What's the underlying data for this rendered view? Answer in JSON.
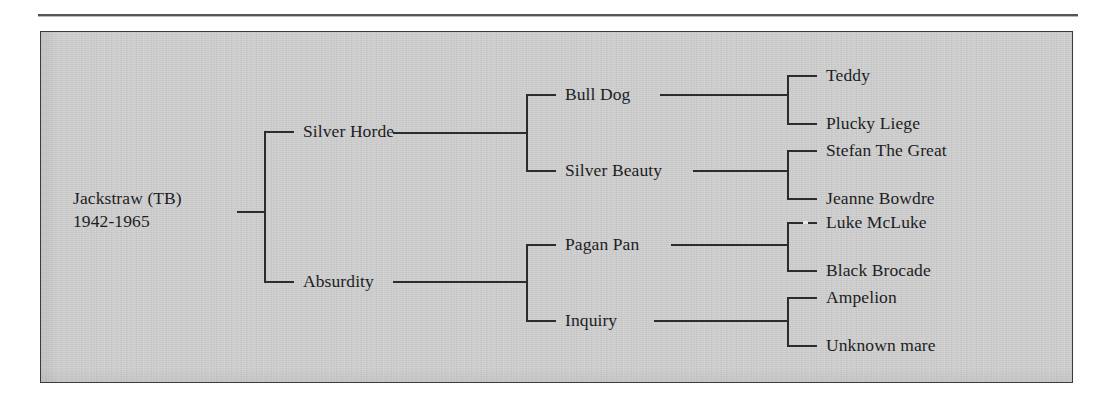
{
  "figure": {
    "background_color": "#c9c9c9",
    "line_color": "#2c2c2e",
    "text_color": "#1d1d1f",
    "type": "pedigree-tree"
  },
  "tree": {
    "root": {
      "name": "Jackstraw (TB)",
      "years": "1942-1965"
    },
    "generation2": [
      {
        "label": "Silver Horde"
      },
      {
        "label": "Absurdity"
      }
    ],
    "generation3": [
      {
        "label": "Bull Dog"
      },
      {
        "label": "Silver Beauty"
      },
      {
        "label": "Pagan Pan"
      },
      {
        "label": "Inquiry"
      }
    ],
    "generation4": [
      {
        "label": "Teddy"
      },
      {
        "label": "Plucky Liege"
      },
      {
        "label": "Stefan The Great"
      },
      {
        "label": "Jeanne Bowdre"
      },
      {
        "label": "Luke McLuke"
      },
      {
        "label": "Black Brocade"
      },
      {
        "label": "Ampelion"
      },
      {
        "label": "Unknown mare"
      }
    ]
  }
}
